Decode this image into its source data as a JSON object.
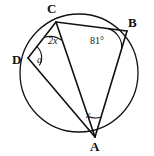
{
  "figure": {
    "type": "geometry-diagram",
    "canvas": {
      "width": 154,
      "height": 156
    },
    "colors": {
      "background": "#ffffff",
      "stroke": "#111111",
      "label": "#111111"
    },
    "circle": {
      "name": "circumscribed-circle",
      "cx": 79,
      "cy": 73,
      "r": 59,
      "stroke_width": 1.3
    },
    "vertices": [
      {
        "id": "C",
        "label": "C",
        "x": 56,
        "y": 22,
        "label_x": 47,
        "label_y": 2
      },
      {
        "id": "B",
        "label": "B",
        "x": 127,
        "y": 31,
        "label_x": 128,
        "label_y": 16
      },
      {
        "id": "D",
        "label": "D",
        "x": 28,
        "y": 58,
        "label_x": 12,
        "label_y": 53
      },
      {
        "id": "A",
        "label": "A",
        "x": 95,
        "y": 137,
        "label_x": 90,
        "label_y": 140
      }
    ],
    "segments": [
      {
        "name": "segment-DC",
        "from": "D",
        "to": "C"
      },
      {
        "name": "segment-CB",
        "from": "C",
        "to": "B"
      },
      {
        "name": "segment-BA",
        "from": "B",
        "to": "A"
      },
      {
        "name": "segment-DA",
        "from": "D",
        "to": "A"
      },
      {
        "name": "segment-CA",
        "from": "C",
        "to": "A"
      }
    ],
    "angle_labels": [
      {
        "id": "angle-2x",
        "text": "2x",
        "at_vertex": "C",
        "x": 48,
        "y": 36,
        "italic": true
      },
      {
        "id": "angle-81",
        "text": "81°",
        "at_vertex": "B",
        "x": 90,
        "y": 36,
        "italic": false
      },
      {
        "id": "angle-a",
        "text": "a",
        "at_vertex": "D",
        "x": 37,
        "y": 55,
        "italic": true
      },
      {
        "id": "angle-x",
        "text": "x",
        "at_vertex": "A",
        "x": 86,
        "y": 110,
        "italic": true
      }
    ]
  }
}
